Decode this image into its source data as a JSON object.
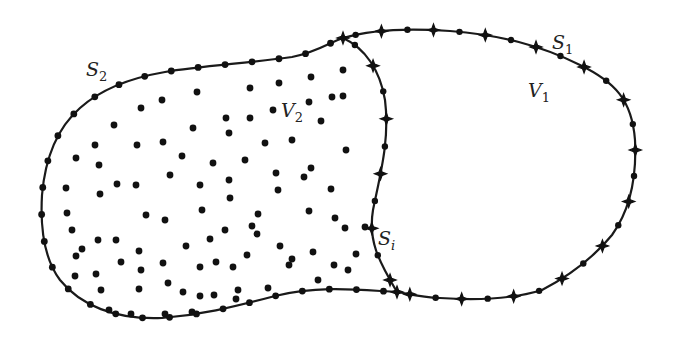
{
  "figure": {
    "colors": {
      "stroke": "#1a1a1a",
      "node": "#111111",
      "background": "#ffffff"
    }
  },
  "labels": {
    "s2": {
      "main": "S",
      "sub": "2"
    },
    "s1": {
      "main": "S",
      "sub": "1"
    },
    "v1": {
      "main": "V",
      "sub": "1"
    },
    "v2": {
      "main": "V",
      "sub": "2"
    },
    "si": {
      "main": "S",
      "sub": "i"
    }
  },
  "legend_semantics": {
    "dot_node": "boundary / interior point (circle marker)",
    "star_node": "boundary node of domain V1 (four-point star marker)"
  }
}
